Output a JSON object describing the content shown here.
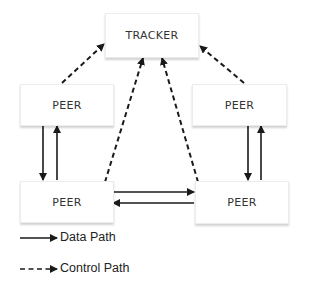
{
  "diagram": {
    "type": "network-topology",
    "nodes": {
      "tracker": {
        "label": "TRACKER"
      },
      "peer_top_left": {
        "label": "PEER"
      },
      "peer_top_right": {
        "label": "PEER"
      },
      "peer_bottom_left": {
        "label": "PEER"
      },
      "peer_bottom_right": {
        "label": "PEER"
      }
    },
    "edges": [
      {
        "from": "peer_top_left",
        "to": "tracker",
        "style": "dashed",
        "kind": "control"
      },
      {
        "from": "peer_top_right",
        "to": "tracker",
        "style": "dashed",
        "kind": "control"
      },
      {
        "from": "peer_bottom_left",
        "to": "tracker",
        "style": "dashed",
        "kind": "control"
      },
      {
        "from": "peer_bottom_right",
        "to": "tracker",
        "style": "dashed",
        "kind": "control"
      },
      {
        "from": "peer_top_left",
        "to": "peer_bottom_left",
        "style": "solid",
        "kind": "data"
      },
      {
        "from": "peer_bottom_left",
        "to": "peer_top_left",
        "style": "solid",
        "kind": "data"
      },
      {
        "from": "peer_top_right",
        "to": "peer_bottom_right",
        "style": "solid",
        "kind": "data"
      },
      {
        "from": "peer_bottom_right",
        "to": "peer_top_right",
        "style": "solid",
        "kind": "data"
      },
      {
        "from": "peer_bottom_left",
        "to": "peer_bottom_right",
        "style": "solid",
        "kind": "data"
      },
      {
        "from": "peer_bottom_right",
        "to": "peer_bottom_left",
        "style": "solid",
        "kind": "data"
      }
    ]
  },
  "legend": {
    "data_path": "Data Path",
    "control_path": "Control Path"
  },
  "colors": {
    "line": "#1a1a1a",
    "node_border": "#ececec",
    "text": "#333333"
  }
}
